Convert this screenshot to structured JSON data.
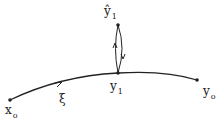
{
  "diagram": {
    "nodes": [
      {
        "id": "x0",
        "label": "x",
        "sub": "o"
      },
      {
        "id": "y1",
        "label": "y",
        "sub": "1"
      },
      {
        "id": "y0",
        "label": "y",
        "sub": "o"
      },
      {
        "id": "y1hat",
        "label": "ŷ",
        "sub": "1"
      }
    ],
    "curve_label": "ξ",
    "edges": [
      {
        "from": "x0",
        "to": "y0",
        "via": "y1",
        "label": "ξ",
        "arrow": "forward"
      },
      {
        "from": "y1",
        "to": "y1hat",
        "arrow": "up"
      },
      {
        "from": "y1hat",
        "to": "y1",
        "arrow": "down"
      }
    ]
  }
}
